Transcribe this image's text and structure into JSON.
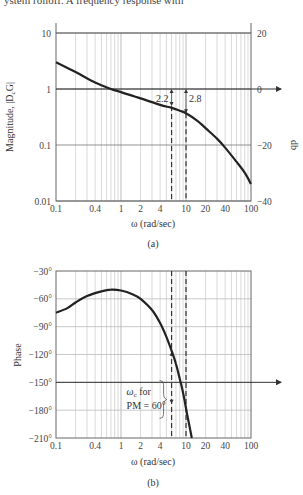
{
  "page": {
    "top_caption": "ystem rolloff. A frequency response with"
  },
  "chart_data": [
    {
      "id": "a",
      "type": "line",
      "caption": "(a)",
      "xlabel": "ω (rad/sec)",
      "ylabel": "Magnitude, |D_cG|",
      "ylabel_left_main": "Magnitude, |D",
      "ylabel_left_sub": "c",
      "ylabel_left_end": "G|",
      "ylabel_right": "db",
      "xscale": "log",
      "yscale": "log",
      "xlim": [
        0.1,
        100
      ],
      "ylim": [
        0.01,
        10
      ],
      "x_ticks": [
        "0.1",
        "0.4",
        "1",
        "2",
        "4",
        "10",
        "20",
        "40",
        "100"
      ],
      "x_tick_values": [
        0.1,
        0.4,
        1,
        2,
        4,
        10,
        20,
        40,
        100
      ],
      "y_ticks": [
        "10",
        "1",
        "0.1",
        "0.01"
      ],
      "y_tick_values": [
        10,
        1,
        0.1,
        0.01
      ],
      "y_right_ticks": [
        "20",
        "0",
        "−20",
        "−40"
      ],
      "y_right_tick_values_db": [
        20,
        0,
        -20,
        -40
      ],
      "grid": true,
      "series": [
        {
          "name": "|D_cG|",
          "x": [
            0.1,
            0.2,
            0.4,
            0.7,
            1,
            2,
            4,
            6,
            8,
            10,
            15,
            20,
            30,
            40,
            60,
            80,
            100
          ],
          "values": [
            3.0,
            2.0,
            1.3,
            1.0,
            0.88,
            0.68,
            0.52,
            0.46,
            0.41,
            0.37,
            0.27,
            0.2,
            0.13,
            0.09,
            0.05,
            0.032,
            0.02
          ]
        }
      ],
      "annotations": [
        {
          "text": "2.2",
          "x": 6,
          "type": "dashed-vertical"
        },
        {
          "text": "2.8",
          "x": 10,
          "type": "dashed-vertical"
        }
      ],
      "zero_db_arrow": true
    },
    {
      "id": "b",
      "type": "line",
      "caption": "(b)",
      "xlabel": "ω (rad/sec)",
      "ylabel": "Phase",
      "xscale": "log",
      "xlim": [
        0.1,
        100
      ],
      "ylim": [
        -210,
        -30
      ],
      "x_ticks": [
        "0.1",
        "0.4",
        "1",
        "2",
        "4",
        "10",
        "20",
        "40",
        "100"
      ],
      "x_tick_values": [
        0.1,
        0.4,
        1,
        2,
        4,
        10,
        20,
        40,
        100
      ],
      "y_ticks": [
        "−30°",
        "−60°",
        "−90°",
        "−120°",
        "−150°",
        "−180°",
        "−210°"
      ],
      "y_tick_values": [
        -30,
        -60,
        -90,
        -120,
        -150,
        -180,
        -210
      ],
      "grid": true,
      "series": [
        {
          "name": "Phase",
          "x": [
            0.1,
            0.15,
            0.2,
            0.3,
            0.5,
            0.7,
            1,
            1.5,
            2,
            3,
            4,
            5,
            6,
            7,
            8,
            9,
            10,
            11,
            12.3
          ],
          "values": [
            -75,
            -70,
            -64,
            -57,
            -52,
            -50,
            -51,
            -55,
            -60,
            -72,
            -86,
            -101,
            -116,
            -130,
            -146,
            -161,
            -178,
            -193,
            -210
          ]
        }
      ],
      "annotations": [
        {
          "text_line1": "ω",
          "text_line1_sub": "c",
          "text_line1_rest": " for",
          "text_line2": "PM = 60°",
          "x_range": [
            6,
            10
          ]
        }
      ],
      "reference_line": -150
    }
  ]
}
